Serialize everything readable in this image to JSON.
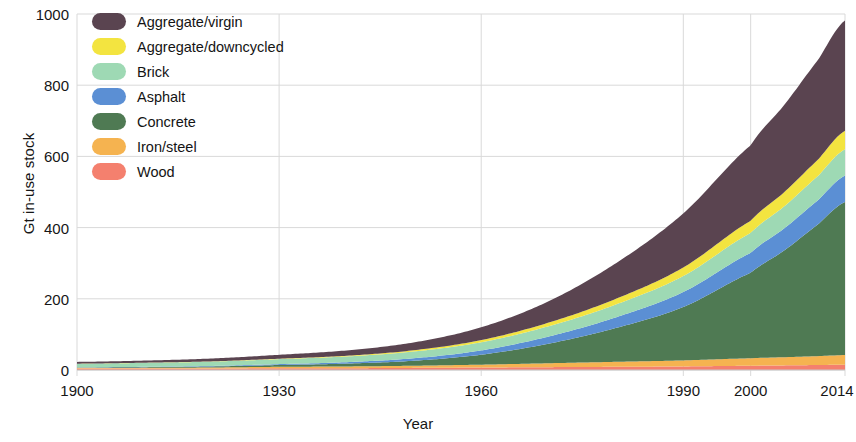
{
  "chart_data": {
    "type": "area",
    "title": "",
    "xlabel": "Year",
    "ylabel": "Gt in-use stock",
    "xlim": [
      1900,
      2014
    ],
    "ylim": [
      0,
      1000
    ],
    "grid": true,
    "stacked": true,
    "legend_position": "top-left",
    "x_ticks": [
      1900,
      1930,
      1960,
      1990,
      2000,
      2014
    ],
    "x_tick_labels": [
      "1900",
      "1930",
      "1960",
      "1990",
      "2000",
      "2014"
    ],
    "y_ticks": [
      0,
      200,
      400,
      600,
      800,
      1000
    ],
    "y_tick_labels": [
      "0",
      "200",
      "400",
      "600",
      "800",
      "1000"
    ],
    "x": [
      1900,
      1910,
      1920,
      1930,
      1940,
      1950,
      1960,
      1970,
      1980,
      1990,
      2000,
      2005,
      2010,
      2014
    ],
    "series": [
      {
        "name": "Wood",
        "color": "#f4806e",
        "values": [
          4,
          4,
          4,
          5,
          5,
          6,
          7,
          8,
          9,
          10,
          12,
          13,
          14,
          15
        ]
      },
      {
        "name": "Iron/steel",
        "color": "#f5b350",
        "values": [
          2,
          2,
          3,
          4,
          5,
          6,
          8,
          11,
          14,
          17,
          21,
          23,
          25,
          27
        ]
      },
      {
        "name": "Concrete",
        "color": "#4f7a53",
        "values": [
          1,
          2,
          3,
          5,
          8,
          14,
          28,
          55,
          95,
          150,
          240,
          300,
          370,
          430
        ]
      },
      {
        "name": "Asphalt",
        "color": "#5b8fd4",
        "values": [
          0.5,
          1,
          1.5,
          2.5,
          4,
          7,
          12,
          20,
          30,
          42,
          56,
          62,
          68,
          74
        ]
      },
      {
        "name": "Brick",
        "color": "#9ed9b4",
        "values": [
          10,
          11,
          12,
          14,
          16,
          19,
          23,
          29,
          36,
          45,
          56,
          62,
          68,
          74
        ]
      },
      {
        "name": "Aggregate/downcycled",
        "color": "#f3e440",
        "values": [
          0.3,
          0.5,
          0.8,
          1.2,
          2,
          3.5,
          6,
          10,
          16,
          24,
          34,
          40,
          46,
          52
        ]
      },
      {
        "name": "Aggregate/virgin",
        "color": "#5a4450",
        "values": [
          5,
          6,
          8,
          11,
          15,
          22,
          36,
          60,
          100,
          152,
          212,
          245,
          280,
          310
        ]
      }
    ],
    "totals": [
      22.8,
      26.5,
      32.3,
      42.7,
      55,
      77.5,
      120,
      193,
      300,
      440,
      631,
      745,
      871,
      942
    ],
    "colors": {
      "aggregate_virgin": "#5a4450",
      "aggregate_downcycled": "#f3e440",
      "brick": "#9ed9b4",
      "asphalt": "#5b8fd4",
      "concrete": "#4f7a53",
      "iron_steel": "#f5b350",
      "wood": "#f4806e",
      "grid": "#d9d9d9",
      "axis_text": "#161616"
    }
  },
  "legend": {
    "items": [
      {
        "label": "Aggregate/virgin",
        "color": "#5a4450"
      },
      {
        "label": "Aggregate/downcycled",
        "color": "#f3e440"
      },
      {
        "label": "Brick",
        "color": "#9ed9b4"
      },
      {
        "label": "Asphalt",
        "color": "#5b8fd4"
      },
      {
        "label": "Concrete",
        "color": "#4f7a53"
      },
      {
        "label": "Iron/steel",
        "color": "#f5b350"
      },
      {
        "label": "Wood",
        "color": "#f4806e"
      }
    ]
  },
  "axes": {
    "y_title": "Gt in-use stock",
    "x_title": "Year"
  }
}
